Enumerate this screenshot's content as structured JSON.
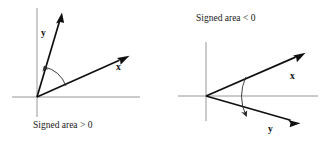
{
  "figure": {
    "background_color": "#ffffff",
    "ink_color": "#101010",
    "axis_color": "#8a8a8a",
    "width": 322,
    "height": 142
  },
  "panels": [
    {
      "id": "left-panel",
      "caption": "Signed area > 0",
      "caption_position": "below",
      "orientation": "counterclockwise",
      "origin": {
        "x": 37,
        "y": 97
      },
      "axes": {
        "horizontal": {
          "x1": 12,
          "y1": 97,
          "x2": 140,
          "y2": 97
        },
        "vertical": {
          "x1": 37,
          "y1": 8,
          "x2": 37,
          "y2": 117
        }
      },
      "vectors": [
        {
          "name": "y",
          "label": "y",
          "label_position": {
            "x": 41,
            "y": 36
          },
          "tip": {
            "x": 62,
            "y": 13
          },
          "angle_deg": 76
        },
        {
          "name": "x",
          "label": "x",
          "label_position": {
            "x": 116,
            "y": 70
          },
          "tip": {
            "x": 129,
            "y": 56
          },
          "angle_deg": 21
        }
      ],
      "angle_arc": {
        "from_vector": "x",
        "to_vector": "y",
        "radius": 31,
        "arrow_at": "y",
        "direction": "counterclockwise"
      }
    },
    {
      "id": "right-panel",
      "caption": "Signed area < 0",
      "caption_position": "above",
      "orientation": "clockwise",
      "origin": {
        "x": 206,
        "y": 96
      },
      "axes": {
        "horizontal": {
          "x1": 178,
          "y1": 96,
          "x2": 318,
          "y2": 96
        },
        "vertical": {
          "x1": 206,
          "y1": 42,
          "x2": 206,
          "y2": 121
        }
      },
      "vectors": [
        {
          "name": "x",
          "label": "x",
          "label_position": {
            "x": 290,
            "y": 79
          },
          "tip": {
            "x": 305,
            "y": 53
          },
          "angle_deg": 25
        },
        {
          "name": "y",
          "label": "y",
          "label_position": {
            "x": 268,
            "y": 132
          },
          "tip": {
            "x": 300,
            "y": 123
          },
          "angle_deg": -28
        }
      ],
      "angle_arc": {
        "from_vector": "x",
        "to_vector": "y",
        "radius": 44,
        "arrow_at": "y",
        "direction": "clockwise"
      }
    }
  ],
  "captions": {
    "left": "Signed area > 0",
    "right": "Signed area < 0"
  },
  "labels": {
    "left_y": "y",
    "left_x": "x",
    "right_x": "x",
    "right_y": "y"
  }
}
